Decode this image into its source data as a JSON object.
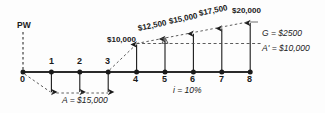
{
  "diagram": {
    "type": "cash-flow-diagram",
    "title_label": "PW",
    "interest_note": "i = 10%",
    "gradient_note": "G = $2500",
    "base_annuity_note": "A' = $10,000",
    "outflow_note": "A = $15,000",
    "axis": {
      "ticks": [
        "0",
        "1",
        "2",
        "3",
        "4",
        "5",
        "6",
        "7",
        "8"
      ],
      "x_positions": [
        23,
        51.4,
        79.8,
        108.2,
        136.6,
        165,
        193.4,
        221.8,
        250.2
      ],
      "baseline_y": 72
    },
    "inflows": [
      {
        "period": "4",
        "label": "$10,000",
        "value": 10000,
        "x": 136.6,
        "tip_y": 43.5,
        "label_x": 107,
        "label_y": 37
      },
      {
        "period": "5",
        "label": "$12,500",
        "value": 12500,
        "x": 165,
        "tip_y": 38,
        "label_x": 140,
        "label_y": 26
      },
      {
        "period": "6",
        "label": "$15,000",
        "value": 15000,
        "x": 193.4,
        "tip_y": 32.8,
        "label_x": 170,
        "label_y": 19
      },
      {
        "period": "7",
        "label": "$17,500",
        "value": 17500,
        "x": 221.8,
        "tip_y": 27.5,
        "label_x": 199,
        "label_y": 11
      },
      {
        "period": "8",
        "label": "$20,000",
        "value": 20000,
        "x": 250.2,
        "tip_y": 22,
        "label_x": 231,
        "label_y": 8
      }
    ],
    "outflows": [
      {
        "period": "1",
        "value": 15000,
        "x": 51.4,
        "tip_y": 93
      },
      {
        "period": "2",
        "value": 15000,
        "x": 79.8,
        "tip_y": 93
      },
      {
        "period": "3",
        "value": 15000,
        "x": 108.2,
        "tip_y": 93
      }
    ],
    "levels": {
      "base_line_y": 43.5,
      "gradient_start_x": 136.6,
      "gradient_end_x": 250.2
    },
    "colors": {
      "stroke": "#1a1a1a",
      "axis": "#333333",
      "background": "#fdfdfd"
    }
  }
}
